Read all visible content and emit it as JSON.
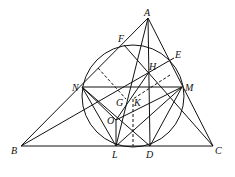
{
  "diagram": {
    "type": "geometry",
    "points": {
      "A": [
        148,
        18
      ],
      "B": [
        21,
        146
      ],
      "C": [
        213,
        146
      ],
      "F": [
        124,
        45
      ],
      "E": [
        174,
        58
      ],
      "H": [
        149,
        72
      ],
      "N": [
        82,
        87
      ],
      "M": [
        182,
        87
      ],
      "L": [
        116,
        146
      ],
      "D": [
        150,
        146
      ],
      "O": [
        116,
        120
      ],
      "G": [
        126,
        99
      ],
      "K": [
        133,
        99
      ]
    },
    "circle": {
      "cx": 133,
      "cy": 96,
      "r": 51
    },
    "labels": [
      {
        "text": "A",
        "x": 144,
        "y": 16
      },
      {
        "text": "F",
        "x": 118,
        "y": 42
      },
      {
        "text": "E",
        "x": 175,
        "y": 58
      },
      {
        "text": "H",
        "x": 149,
        "y": 70
      },
      {
        "text": "N",
        "x": 72,
        "y": 91
      },
      {
        "text": "M",
        "x": 185,
        "y": 91
      },
      {
        "text": "G",
        "x": 116,
        "y": 106
      },
      {
        "text": "K",
        "x": 134,
        "y": 106
      },
      {
        "text": "O",
        "x": 107,
        "y": 124
      },
      {
        "text": "B",
        "x": 11,
        "y": 154
      },
      {
        "text": "L",
        "x": 112,
        "y": 158
      },
      {
        "text": "D",
        "x": 146,
        "y": 158
      },
      {
        "text": "C",
        "x": 215,
        "y": 154
      }
    ]
  }
}
